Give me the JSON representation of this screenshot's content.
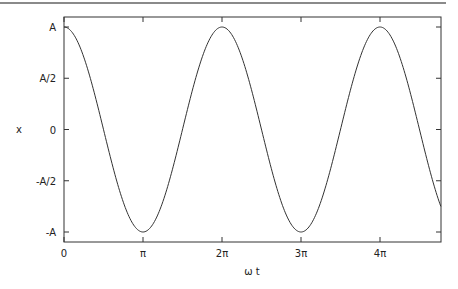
{
  "chart_data": {
    "type": "line",
    "title": "",
    "xlabel": "ω t",
    "ylabel": "x",
    "x_tick_labels": [
      "0",
      "π",
      "2π",
      "3π",
      "4π"
    ],
    "x_tick_values_in_pi": [
      0,
      1,
      2,
      3,
      4
    ],
    "y_tick_labels": [
      "A",
      "A/2",
      "0",
      "-A/2",
      "-A"
    ],
    "y_tick_values": [
      1,
      0.5,
      0,
      -0.5,
      -1
    ],
    "xlim_in_pi": [
      0,
      4.77
    ],
    "ylim": [
      -1.1,
      1.1
    ],
    "grid": false,
    "legend": null,
    "series": [
      {
        "name": "x = A cos(ωt)",
        "function": "cos",
        "amplitude": 1,
        "color": "#333333"
      }
    ],
    "sample_points": {
      "x_in_pi": [
        0,
        0.5,
        1,
        1.5,
        2,
        2.5,
        3,
        3.5,
        4,
        4.5,
        4.77
      ],
      "y": [
        1,
        0,
        -1,
        0,
        1,
        0,
        -1,
        0,
        1,
        0,
        -0.75
      ]
    }
  },
  "colors": {
    "axis": "#333333",
    "curve": "#333333",
    "top_rule": "#8a8a8a",
    "background": "#ffffff"
  }
}
